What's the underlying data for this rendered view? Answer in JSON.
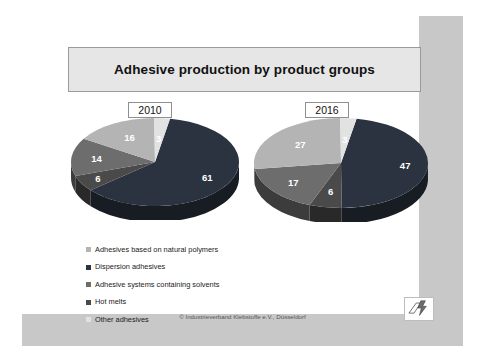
{
  "slide": {
    "title": "Adhesive production by product groups",
    "credit": "© Industrieverband Klebstoffe e.V., Düsseldorf",
    "logo_icon": "industrieverband-klebstoffe-logo-icon"
  },
  "years": {
    "left": "2010",
    "right": "2016"
  },
  "legend": {
    "items": [
      {
        "label": "Adhesives based on natural polymers",
        "color": "#b4b4b4"
      },
      {
        "label": "Dispersion adhesives",
        "color": "#2b3340"
      },
      {
        "label": "Adhesive systems containing solvents",
        "color": "#6d6d6d"
      },
      {
        "label": "Hot melts",
        "color": "#4a4a4a"
      },
      {
        "label": "Other adhesives",
        "color": "#e2e2e2"
      }
    ]
  },
  "chart_data": [
    {
      "type": "pie",
      "title": "2010",
      "categories": [
        "Dispersion adhesives",
        "Adhesive systems containing solvents",
        "Hot melts",
        "Adhesives based on natural polymers",
        "Other adhesives"
      ],
      "values": [
        61,
        6,
        14,
        16,
        3
      ],
      "labels": [
        "61",
        "6",
        "14",
        "16",
        "3"
      ],
      "colors": [
        "#2b3340",
        "#4a4a4a",
        "#6d6d6d",
        "#b4b4b4",
        "#e2e2e2"
      ],
      "label_colors": [
        "#ffffff",
        "#ffffff",
        "#ffffff",
        "#ffffff",
        "#ffffff"
      ],
      "unit": "percent",
      "legend": "below",
      "grid": false
    },
    {
      "type": "pie",
      "title": "2016",
      "categories": [
        "Dispersion adhesives",
        "Adhesive systems containing solvents",
        "Hot melts",
        "Adhesives based on natural polymers",
        "Other adhesives"
      ],
      "values": [
        47,
        6,
        17,
        27,
        3
      ],
      "labels": [
        "47",
        "6",
        "17",
        "27",
        "3"
      ],
      "colors": [
        "#2b3340",
        "#4a4a4a",
        "#6d6d6d",
        "#b4b4b4",
        "#e2e2e2"
      ],
      "label_colors": [
        "#ffffff",
        "#ffffff",
        "#ffffff",
        "#ffffff",
        "#ffffff"
      ],
      "unit": "percent",
      "legend": "below",
      "grid": false
    }
  ]
}
